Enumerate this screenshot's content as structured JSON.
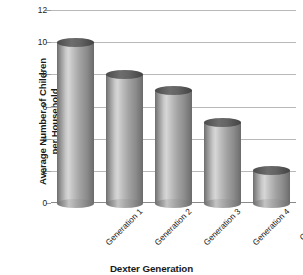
{
  "chart_data": {
    "type": "bar",
    "title": "",
    "subtitle": "",
    "xlabel": "Dexter Generation",
    "ylabel": "Average Number of Children\nper Household",
    "categories": [
      "Generation 1",
      "Generation 2",
      "Generation 3",
      "Generation 4",
      "Generation 5\n(current)"
    ],
    "values": [
      10,
      8,
      7,
      5,
      2
    ],
    "ylim": [
      0,
      12
    ],
    "yticks": [
      0,
      2,
      4,
      6,
      8,
      10,
      12
    ],
    "ytick_labels": [
      "0",
      "2",
      "4",
      "6",
      "8",
      "10",
      "12"
    ],
    "grid": "horizontal",
    "legend": "none",
    "bar_style": "cylinder",
    "colors": {
      "bar_light": "#d6d6d6",
      "bar_mid": "#a2a2a2",
      "bar_dark": "#6a6a6a",
      "bar_cap": "#5d5d5d",
      "gridline": "#b8b8b8",
      "axis": "#8a8a8a",
      "text": "#1d1d1d",
      "background": "#ffffff"
    }
  }
}
